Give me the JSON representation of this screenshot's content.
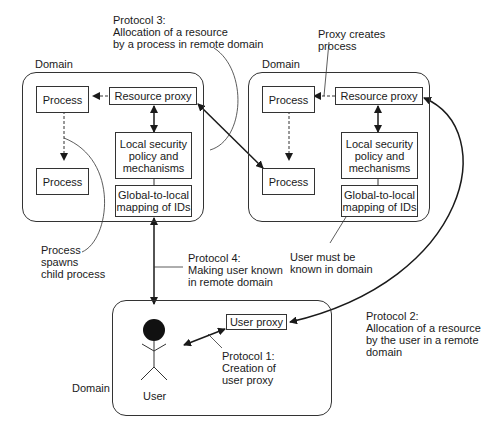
{
  "diagram": {
    "domains": {
      "left": {
        "label": "Domain",
        "process_top": "Process",
        "process_bottom": "Process",
        "resource_proxy": "Resource proxy",
        "security": [
          "Local security",
          "policy and",
          "mechanisms"
        ],
        "mapping": [
          "Global-to-local",
          "mapping of IDs"
        ]
      },
      "right": {
        "label": "Domain",
        "process_top": "Process",
        "process_bottom": "Process",
        "resource_proxy": "Resource proxy",
        "security": [
          "Local security",
          "policy and",
          "mechanisms"
        ],
        "mapping": [
          "Global-to-local",
          "mapping of IDs"
        ]
      },
      "user": {
        "label": "Domain",
        "user_proxy": "User proxy",
        "user_label": "User"
      }
    },
    "annotations": {
      "protocol3": [
        "Protocol 3:",
        "Allocation of a resource",
        "by a process in remote domain"
      ],
      "proxy_creates": [
        "Proxy creates",
        "process"
      ],
      "spawns": [
        "Process",
        "spawns",
        "child process"
      ],
      "protocol4": [
        "Protocol 4:",
        "Making user known",
        "in remote domain"
      ],
      "user_known": [
        "User must be",
        "known in domain"
      ],
      "protocol1": [
        "Protocol 1:",
        "Creation of",
        "user proxy"
      ],
      "protocol2": [
        "Protocol 2:",
        "Allocation of a resource",
        "by the user in a remote",
        "domain"
      ]
    }
  }
}
